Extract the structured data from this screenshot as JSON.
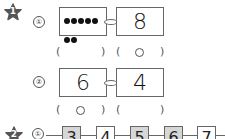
{
  "problem1": {
    "number": "1",
    "items": [
      {
        "label": "①",
        "left": {
          "type": "dots",
          "count": 7
        },
        "right": {
          "type": "number",
          "value": "8"
        },
        "answers": {
          "left": "",
          "right": "○"
        }
      },
      {
        "label": "②",
        "left": {
          "type": "number",
          "value": "6"
        },
        "right": {
          "type": "number",
          "value": "4"
        },
        "answers": {
          "left": "○",
          "right": ""
        }
      }
    ]
  },
  "problem2": {
    "number": "2",
    "items": [
      {
        "label": "①",
        "sequence": [
          {
            "value": "3",
            "shaded": true
          },
          {
            "value": "4",
            "shaded": false
          },
          {
            "value": "5",
            "shaded": true
          },
          {
            "value": "6",
            "shaded": true
          },
          {
            "value": "7",
            "shaded": false
          }
        ]
      }
    ]
  },
  "symbols": {
    "open_paren": "(",
    "close_paren": ")"
  }
}
